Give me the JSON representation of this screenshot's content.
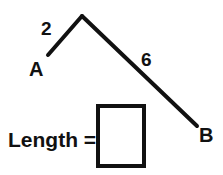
{
  "figure": {
    "stroke_color": "#111111",
    "background_color": "#ffffff",
    "stroke_width": 4,
    "points": {
      "a": {
        "label": "A",
        "x": 48,
        "y": 55
      },
      "apex": {
        "label": "",
        "x": 82,
        "y": 16
      },
      "b": {
        "label": "B",
        "x": 197,
        "y": 126
      }
    },
    "segments": [
      {
        "name": "segment-a-apex",
        "label": "2",
        "value": 2,
        "from": "a",
        "to": "apex"
      },
      {
        "name": "segment-apex-b",
        "label": "6",
        "value": 6,
        "from": "apex",
        "to": "b"
      }
    ]
  },
  "answer": {
    "prompt": "Length =",
    "value": "",
    "placeholder": ""
  }
}
